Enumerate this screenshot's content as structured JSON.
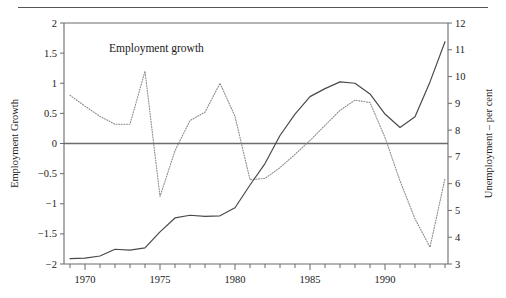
{
  "figure": {
    "top_rule": true,
    "background": "#ffffff",
    "frame_color": "#6b6b6b"
  },
  "chart_data": {
    "type": "line",
    "title": "",
    "subtitle": "",
    "xlabel": "",
    "grid": false,
    "legend_position": "inline-annotations",
    "xlim": [
      1968.6,
      1994.2
    ],
    "x_ticks_major": [
      1970,
      1975,
      1980,
      1985,
      1990
    ],
    "x_tick_labels": [
      "1970",
      "1975",
      "1980",
      "1985",
      "1990"
    ],
    "x_ticks_minor": [
      1969,
      1971,
      1972,
      1973,
      1974,
      1976,
      1977,
      1978,
      1979,
      1981,
      1982,
      1983,
      1984,
      1986,
      1987,
      1988,
      1989,
      1991,
      1992,
      1993,
      1994
    ],
    "left_axis": {
      "label": "Employment Growth",
      "ylim": [
        -2,
        2
      ],
      "ticks": [
        -2,
        -1.5,
        -1,
        -0.5,
        0,
        0.5,
        1,
        1.5,
        2
      ],
      "tick_labels": [
        "−2",
        "−1.5",
        "−1",
        "−0.5",
        "0",
        "0.5",
        "1",
        "1.5",
        "2"
      ]
    },
    "right_axis": {
      "label": "Unemployment – per cent",
      "ylim": [
        3,
        12
      ],
      "ticks": [
        3,
        4,
        5,
        6,
        7,
        8,
        9,
        10,
        11,
        12
      ],
      "tick_labels": [
        "3",
        "4",
        "5",
        "6",
        "7",
        "8",
        "9",
        "10",
        "11",
        "12"
      ]
    },
    "zero_line": {
      "value": 0,
      "axis": "left",
      "color": "#6b6b6b"
    },
    "series": [
      {
        "name": "Employment growth",
        "annotation": "Employment growth",
        "annotation_x": 1971.6,
        "annotation_y": 1.52,
        "axis": "left",
        "style": "dotted",
        "color": "#8a8a8a",
        "x": [
          1969,
          1970,
          1971,
          1972,
          1973,
          1974,
          1975,
          1976,
          1977,
          1978,
          1979,
          1980,
          1981,
          1982,
          1983,
          1984,
          1985,
          1986,
          1987,
          1988,
          1989,
          1990,
          1991,
          1992,
          1993,
          1994
        ],
        "values": [
          0.8,
          0.62,
          0.45,
          0.32,
          0.32,
          1.2,
          -0.88,
          -0.12,
          0.38,
          0.52,
          1.0,
          0.45,
          -0.6,
          -0.58,
          -0.4,
          -0.18,
          0.05,
          0.3,
          0.55,
          0.72,
          0.68,
          0.1,
          -0.62,
          -1.25,
          -1.72,
          -0.58
        ]
      },
      {
        "name": "Unemployment",
        "annotation": "Unemployment",
        "annotation_x": 1976.6,
        "annotation_y": -1.2,
        "axis": "right",
        "style": "solid",
        "color": "#4a4a4a",
        "x": [
          1969,
          1970,
          1971,
          1972,
          1973,
          1974,
          1975,
          1976,
          1977,
          1978,
          1979,
          1980,
          1981,
          1982,
          1983,
          1984,
          1985,
          1986,
          1987,
          1988,
          1989,
          1990,
          1991,
          1992,
          1993,
          1994
        ],
        "values": [
          3.2,
          3.22,
          3.3,
          3.55,
          3.52,
          3.6,
          4.2,
          4.72,
          4.82,
          4.78,
          4.8,
          5.1,
          5.95,
          6.75,
          7.8,
          8.6,
          9.25,
          9.55,
          9.8,
          9.75,
          9.35,
          8.6,
          8.1,
          8.5,
          9.8,
          11.3
        ]
      }
    ]
  }
}
